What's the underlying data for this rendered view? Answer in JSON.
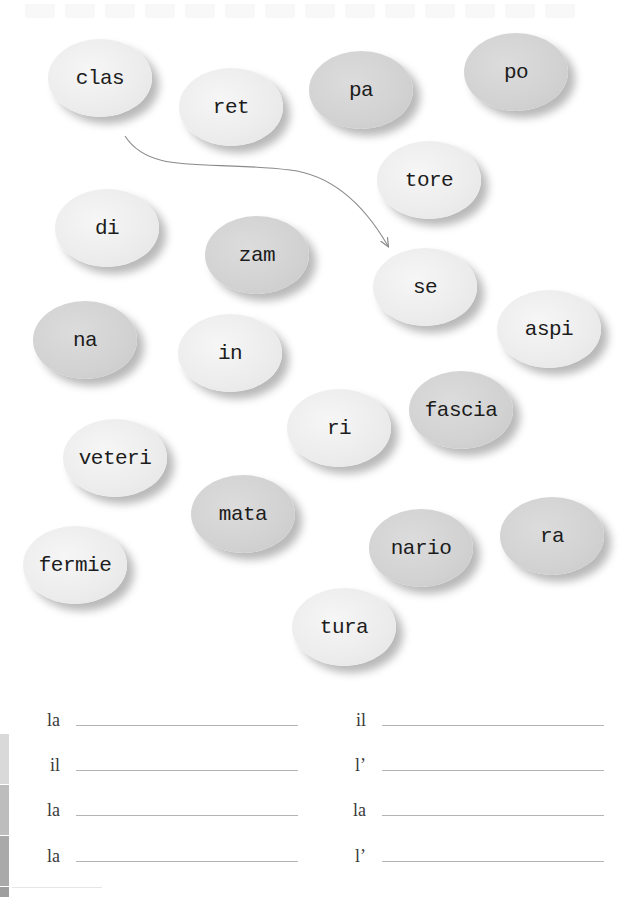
{
  "worksheet": {
    "syllables": [
      {
        "id": "clas",
        "text": "clas",
        "cx": 100,
        "cy": 78,
        "shade": "light"
      },
      {
        "id": "ret",
        "text": "ret",
        "cx": 231,
        "cy": 107,
        "shade": "light"
      },
      {
        "id": "pa",
        "text": "pa",
        "cx": 361,
        "cy": 90,
        "shade": "dark"
      },
      {
        "id": "po",
        "text": "po",
        "cx": 516,
        "cy": 72,
        "shade": "dark"
      },
      {
        "id": "tore",
        "text": "tore",
        "cx": 429,
        "cy": 180,
        "shade": "light"
      },
      {
        "id": "di",
        "text": "di",
        "cx": 107,
        "cy": 228,
        "shade": "light"
      },
      {
        "id": "zam",
        "text": "zam",
        "cx": 257,
        "cy": 255,
        "shade": "dark"
      },
      {
        "id": "se",
        "text": "se",
        "cx": 425,
        "cy": 287,
        "shade": "light"
      },
      {
        "id": "na",
        "text": "na",
        "cx": 85,
        "cy": 340,
        "shade": "dark"
      },
      {
        "id": "in",
        "text": "in",
        "cx": 230,
        "cy": 353,
        "shade": "light"
      },
      {
        "id": "aspi",
        "text": "aspi",
        "cx": 549,
        "cy": 329,
        "shade": "light"
      },
      {
        "id": "fascia",
        "text": "fascia",
        "cx": 461,
        "cy": 410,
        "shade": "dark"
      },
      {
        "id": "ri",
        "text": "ri",
        "cx": 339,
        "cy": 428,
        "shade": "light"
      },
      {
        "id": "veteri",
        "text": "veteri",
        "cx": 115,
        "cy": 458,
        "shade": "light"
      },
      {
        "id": "mata",
        "text": "mata",
        "cx": 243,
        "cy": 514,
        "shade": "dark"
      },
      {
        "id": "ra",
        "text": "ra",
        "cx": 552,
        "cy": 536,
        "shade": "dark"
      },
      {
        "id": "nario",
        "text": "nario",
        "cx": 421,
        "cy": 548,
        "shade": "dark"
      },
      {
        "id": "fermie",
        "text": "fermie",
        "cx": 75,
        "cy": 565,
        "shade": "light"
      },
      {
        "id": "tura",
        "text": "tura",
        "cx": 344,
        "cy": 627,
        "shade": "light"
      }
    ],
    "example_arrow": {
      "from": "clas",
      "to": "se",
      "path": "M 125 136 C 150 175, 205 160, 290 170 C 340 176, 370 215, 388 246",
      "color": "#8a8a8a"
    },
    "answers": {
      "left_column": [
        {
          "article": "la",
          "value": ""
        },
        {
          "article": "il",
          "value": ""
        },
        {
          "article": "la",
          "value": ""
        },
        {
          "article": "la",
          "value": ""
        }
      ],
      "right_column": [
        {
          "article": "il",
          "value": ""
        },
        {
          "article": "l’",
          "value": ""
        },
        {
          "article": "la",
          "value": ""
        },
        {
          "article": "l’",
          "value": ""
        }
      ]
    }
  },
  "colors": {
    "oval_light": "#ececec",
    "oval_dark": "#d2d2d2",
    "text": "#1c1c1c",
    "line": "#b4b4b4"
  }
}
